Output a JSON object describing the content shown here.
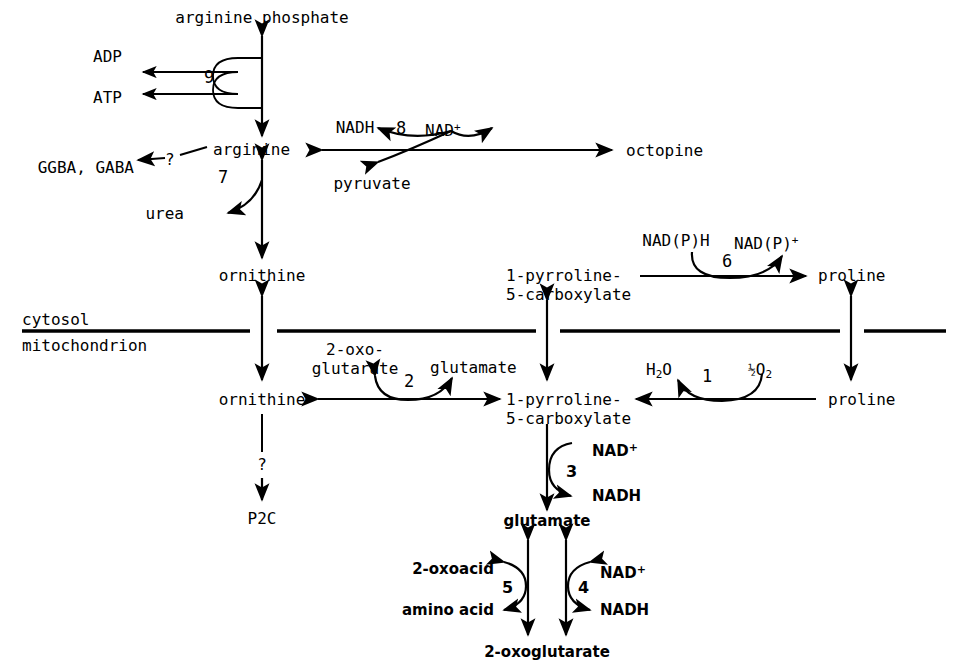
{
  "figure": {
    "type": "metabolic-pathway-diagram",
    "compartments": {
      "upper_label": "cytosol",
      "lower_label": "mitochondrion"
    }
  },
  "metabolites": {
    "arginine_phosphate": "arginine phosphate",
    "adp": "ADP",
    "atp": "ATP",
    "arginine": "arginine",
    "ggba_gaba": "GGBA, GABA",
    "urea": "urea",
    "nadh_8": "NADH",
    "nad_plus_8": "NAD",
    "nad_plus_8_sup": "+",
    "pyruvate": "pyruvate",
    "octopine": "octopine",
    "ornithine_cytosol": "ornithine",
    "ornithine_mito": "ornithine",
    "p5c_cytosol_line1": "1-pyrroline-",
    "p5c_cytosol_line2": "5-carboxylate",
    "p5c_mito_line1": "1-pyrroline-",
    "p5c_mito_line2": "5-carboxylate",
    "nadph_6": "NAD(P)H",
    "nadp_plus_6": "NAD(P)",
    "nadp_plus_6_sup": "+",
    "proline_cytosol": "proline",
    "proline_mito": "proline",
    "oxoglutarate_line1": "2-oxo-",
    "oxoglutarate_line2": "glutarate",
    "glutamate_2": "glutamate",
    "water": "H",
    "water_sub": "2",
    "water_tail": "O",
    "half_oxygen_frac": "½",
    "half_oxygen_el": "O",
    "half_oxygen_sub": "2",
    "p2c": "P2C",
    "nad_plus_3": "NAD",
    "nad_plus_3_sup": "+",
    "nadh_3": "NADH",
    "glutamate_bottom": "glutamate",
    "oxoacid": "2-oxoacid",
    "amino_acid": "amino acid",
    "nad_plus_4": "NAD",
    "nad_plus_4_sup": "+",
    "nadh_4": "NADH",
    "oxoglutarate_bottom": "2-oxoglutarate"
  },
  "enzymes": [
    {
      "id": "1",
      "label": "1",
      "reaction": "proline to 1-pyrroline-5-carboxylate (mitochondrion)"
    },
    {
      "id": "2",
      "label": "2",
      "reaction": "ornithine to 1-pyrroline-5-carboxylate (mitochondrion)"
    },
    {
      "id": "3",
      "label": "3",
      "reaction": "1-pyrroline-5-carboxylate to glutamate"
    },
    {
      "id": "4",
      "label": "4",
      "reaction": "glutamate to 2-oxoglutarate, NAD-linked"
    },
    {
      "id": "5",
      "label": "5",
      "reaction": "glutamate to 2-oxoglutarate, transaminase"
    },
    {
      "id": "6",
      "label": "6",
      "reaction": "1-pyrroline-5-carboxylate to proline (cytosol)"
    },
    {
      "id": "7",
      "label": "7",
      "reaction": "arginine to ornithine, releasing urea"
    },
    {
      "id": "8",
      "label": "8",
      "reaction": "arginine to octopine"
    },
    {
      "id": "9",
      "label": "9",
      "reaction": "arginine phosphate to arginine"
    }
  ],
  "unknown_markers": {
    "arginine_to_ggba": "?",
    "ornithine_to_p2c": "?"
  },
  "colors": {
    "stroke": "#000000",
    "text": "#000000",
    "background": "#ffffff"
  }
}
